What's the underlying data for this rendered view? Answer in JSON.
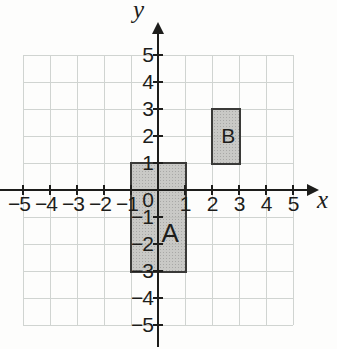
{
  "figure": {
    "background": "#fdfdfc",
    "grid_color": "#d0d4d1",
    "axis_color": "#1d1d1b",
    "text_color": "#1d1d1b",
    "shape_fill": "#c9c9c7",
    "shape_border": "#3a3a38"
  },
  "plane": {
    "x_min": -5,
    "x_max": 5,
    "y_min": -5,
    "y_max": 5,
    "x_axis_label": "x",
    "y_axis_label": "y",
    "origin_label": "0",
    "x_tick_labels": [
      {
        "value": -5,
        "label": "−5"
      },
      {
        "value": -4,
        "label": "−4"
      },
      {
        "value": -3,
        "label": "−3"
      },
      {
        "value": -2,
        "label": "−2"
      },
      {
        "value": -1,
        "label": "−1"
      },
      {
        "value": 1,
        "label": "1"
      },
      {
        "value": 2,
        "label": "2"
      },
      {
        "value": 3,
        "label": "3"
      },
      {
        "value": 4,
        "label": "4"
      },
      {
        "value": 5,
        "label": "5"
      }
    ],
    "y_tick_labels": [
      {
        "value": 5,
        "label": "5"
      },
      {
        "value": 4,
        "label": "4"
      },
      {
        "value": 3,
        "label": "3"
      },
      {
        "value": 2,
        "label": "2"
      },
      {
        "value": 1,
        "label": "1"
      },
      {
        "value": -1,
        "label": "−1"
      },
      {
        "value": -2,
        "label": "−2"
      },
      {
        "value": -3,
        "label": "−3"
      },
      {
        "value": -4,
        "label": "−4"
      },
      {
        "value": -5,
        "label": "−5"
      }
    ]
  },
  "shapes": [
    {
      "id": "A",
      "label": "A",
      "x1": -1,
      "y1": -3,
      "x2": 1,
      "y2": 1,
      "label_x": 0.45,
      "label_y": -1.6
    },
    {
      "id": "B",
      "label": "B",
      "x1": 2,
      "y1": 1,
      "x2": 3,
      "y2": 3,
      "label_x": 2.6,
      "label_y": 2.0
    }
  ]
}
